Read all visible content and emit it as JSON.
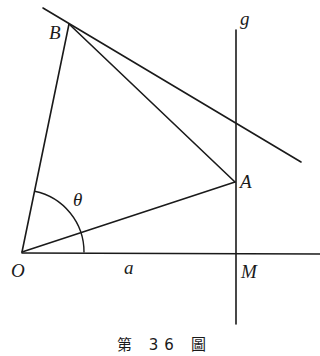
{
  "figure": {
    "caption": "第 36 圖",
    "labels": {
      "B": "B",
      "g": "g",
      "theta": "θ",
      "A": "A",
      "O": "O",
      "a": "a",
      "M": "M"
    },
    "points": {
      "O": [
        22,
        252
      ],
      "A": [
        235,
        182
      ],
      "B": [
        69,
        24
      ],
      "M": [
        235,
        253
      ]
    },
    "lines": [
      {
        "name": "OB",
        "from": [
          22,
          252
        ],
        "to": [
          69,
          24
        ]
      },
      {
        "name": "OA",
        "from": [
          22,
          252
        ],
        "to": [
          235,
          182
        ]
      },
      {
        "name": "BA",
        "from": [
          69,
          24
        ],
        "to": [
          235,
          182
        ]
      },
      {
        "name": "tangent-through-B",
        "from": [
          43,
          8
        ],
        "to": [
          301,
          162
        ]
      },
      {
        "name": "line-g",
        "from": [
          236,
          30
        ],
        "to": [
          236,
          324
        ]
      },
      {
        "name": "axis-OM",
        "from": [
          22,
          253
        ],
        "to": [
          320,
          254
        ]
      }
    ],
    "angle_arc": {
      "center": [
        22,
        252
      ],
      "radius": 62,
      "label": "θ"
    }
  }
}
